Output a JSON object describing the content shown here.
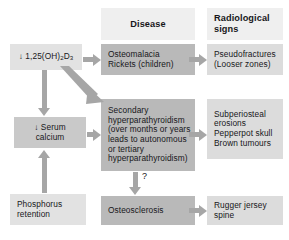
{
  "diagram": {
    "headers": {
      "disease": "Disease",
      "radiological_line1": "Radiological",
      "radiological_line2": "signs"
    },
    "left_column": [
      {
        "id": "calcitriol",
        "label_prefix": "↓ 1,25(OH)",
        "label_sub1": "2",
        "label_mid": "D",
        "label_sub2": "3"
      },
      {
        "id": "serum-calcium",
        "line1": "↓ Serum",
        "line2": "calcium"
      },
      {
        "id": "phosphorus-retention",
        "line1": "Phosphorus",
        "line2": "retention"
      }
    ],
    "disease_column": [
      {
        "id": "osteomalacia",
        "lines": [
          "Osteomalacia",
          "Rickets (children)"
        ]
      },
      {
        "id": "secondary-hyperparathyroidism",
        "lines": [
          "Secondary",
          "hyperparathyroidism",
          "(over months or years",
          "leads to autonomous",
          "or tertiary",
          "hyperparathyroidism)"
        ]
      },
      {
        "id": "osteosclerosis",
        "lines": [
          "Osteosclerosis"
        ]
      }
    ],
    "signs_column": [
      {
        "id": "pseudofractures",
        "lines": [
          "Pseudofractures",
          "(Looser zones)"
        ]
      },
      {
        "id": "hyperparathyroid-signs",
        "lines": [
          "Subperiosteal",
          "erosions",
          "Pepperpot skull",
          "Brown tumours"
        ]
      },
      {
        "id": "rugger-jersey-spine",
        "lines": [
          "Rugger jersey",
          "spine"
        ]
      }
    ],
    "annotations": {
      "uncertain_link": "?"
    },
    "colors": {
      "header_fill": "#efefef",
      "left_fill": "#e2e2e2",
      "left_mid_fill": "#c9c9c9",
      "disease_fill": "#b9b9b9",
      "signs_fill": "#dcdcdc",
      "arrow": "#a6a6a6",
      "text": "#17171a",
      "background": "#ffffff"
    }
  }
}
